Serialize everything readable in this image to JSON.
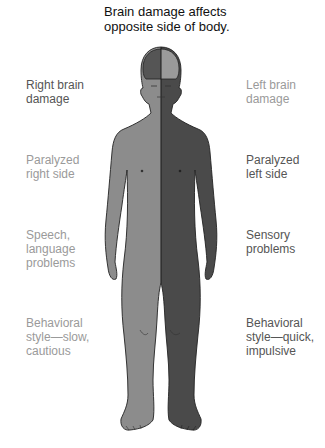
{
  "title": [
    "Brain damage affects",
    "opposite side of body."
  ],
  "left_labels": [
    {
      "lines": [
        "Right brain",
        "damage"
      ],
      "tone": "dark"
    },
    {
      "lines": [
        "Paralyzed",
        "right side"
      ],
      "tone": "light"
    },
    {
      "lines": [
        "Speech,",
        "language",
        "problems"
      ],
      "tone": "light"
    },
    {
      "lines": [
        "Behavioral",
        "style—slow,",
        "cautious"
      ],
      "tone": "light"
    }
  ],
  "right_labels": [
    {
      "lines": [
        "Left brain",
        "damage"
      ],
      "tone": "light"
    },
    {
      "lines": [
        "Paralyzed",
        "left side"
      ],
      "tone": "dark"
    },
    {
      "lines": [
        "Sensory",
        "problems"
      ],
      "tone": "dark"
    },
    {
      "lines": [
        "Behavioral",
        "style—quick,",
        "impulsive"
      ],
      "tone": "dark"
    }
  ],
  "colors": {
    "body_light": "#8c8c8c",
    "body_dark": "#4a4a4a",
    "brain_right_hemisphere": "#555555",
    "brain_left_hemisphere": "#9a9a9a",
    "outline": "#222222"
  }
}
